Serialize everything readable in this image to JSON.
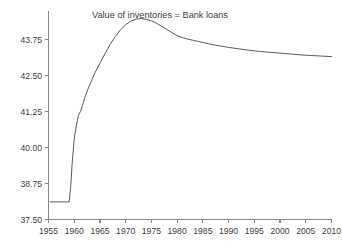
{
  "chart_data": {
    "type": "line",
    "title": "Value of inventories = Bank loans",
    "xlabel": "",
    "ylabel": "",
    "xlim": [
      1955,
      2010
    ],
    "ylim": [
      37.5,
      44.75
    ],
    "grid": false,
    "legend": null,
    "legend_position": "none",
    "x_ticks": [
      1955,
      1960,
      1965,
      1970,
      1975,
      1980,
      1985,
      1990,
      1995,
      2000,
      2005,
      2010
    ],
    "x_tick_labels": [
      "1955",
      "1960",
      "1965",
      "1970",
      "1975",
      "1980",
      "1985",
      "1990",
      "1995",
      "2000",
      "2005",
      "2010"
    ],
    "y_ticks": [
      37.5,
      38.75,
      40.0,
      41.25,
      42.5,
      43.75
    ],
    "y_tick_labels": [
      "37.50",
      "38.75",
      "40.00",
      "41.25",
      "42.50",
      "43.75"
    ],
    "line_color": "#5a5a5a",
    "axis_color": "#8a8a8a",
    "series": [
      {
        "name": "Value of inventories = Bank loans",
        "x": [
          1955.3,
          1956,
          1957,
          1958,
          1959.0,
          1959.3,
          1959.6,
          1960.0,
          1960.4,
          1960.8,
          1961.2,
          1961.6,
          1962.0,
          1962.6,
          1963.2,
          1964.0,
          1965.0,
          1966.0,
          1967.0,
          1968.0,
          1969.0,
          1970.0,
          1971.0,
          1972.0,
          1973.0,
          1974.0,
          1975.0,
          1976.0,
          1977.0,
          1978.0,
          1979.0,
          1980.0,
          1981.0,
          1982.0,
          1983.0,
          1984.0,
          1985.0,
          1986.0,
          1987.0,
          1988.0,
          1990.0,
          1992.0,
          1994.0,
          1996.0,
          1998.0,
          2000.0,
          2002.0,
          2004.0,
          2006.0,
          2008.0,
          2010.0
        ],
        "y": [
          38.11,
          38.11,
          38.11,
          38.11,
          38.11,
          38.6,
          39.45,
          40.3,
          40.75,
          41.1,
          41.25,
          41.45,
          41.7,
          42.0,
          42.25,
          42.58,
          42.92,
          43.26,
          43.58,
          43.85,
          44.08,
          44.26,
          44.38,
          44.45,
          44.47,
          44.45,
          44.39,
          44.31,
          44.2,
          44.09,
          43.98,
          43.88,
          43.81,
          43.76,
          43.72,
          43.68,
          43.64,
          43.6,
          43.56,
          43.53,
          43.47,
          43.42,
          43.37,
          43.33,
          43.3,
          43.27,
          43.24,
          43.21,
          43.19,
          43.17,
          43.15
        ]
      }
    ]
  },
  "title_block": {
    "text": "Value of inventories = Bank loans"
  }
}
